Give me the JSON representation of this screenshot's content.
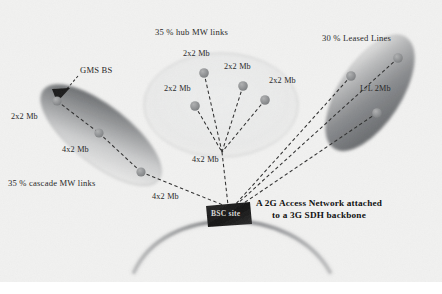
{
  "figure": {
    "background_color": "#f3f3f2",
    "ink_color": "#2a2a2a",
    "node_color": "#8f8f8f",
    "cloud_fill_dark": "#6f7173",
    "cloud_fill_light": "#e9e9e8",
    "bsc_box_color": "#1e1e1e",
    "backbone_arc_color": "#8c8d8e"
  },
  "regions": {
    "cascade": {
      "title": "35 % cascade MW links",
      "bs_label": "GMS BS",
      "link_labels": [
        "2x2 Mb",
        "4x2 Mb"
      ],
      "trunk_label": "4x2 Mb"
    },
    "hub": {
      "title": "35 % hub MW links",
      "node_labels": [
        "2x2 Mb",
        "2x2 Mb",
        "2x2 Mb",
        "2x2 Mb"
      ],
      "trunk_label": "4x2 Mb"
    },
    "leased": {
      "title": "30 % Leased Lines",
      "link_label": "L/L 2Mb"
    }
  },
  "core": {
    "bsc_site_label": "BSC site",
    "caption_line_1": "A 2G Access Network attached",
    "caption_line_2": "to a 3G SDH backbone"
  },
  "nodes": {
    "cascade": [
      {
        "name": "gms-bs-node",
        "x": 57,
        "y": 101
      },
      {
        "name": "cascade-mid-node",
        "x": 99,
        "y": 133
      },
      {
        "name": "cascade-end-node",
        "x": 141,
        "y": 172
      }
    ],
    "hub": [
      {
        "name": "hub-node-1",
        "x": 195,
        "y": 106
      },
      {
        "name": "hub-node-2",
        "x": 204,
        "y": 73
      },
      {
        "name": "hub-node-3",
        "x": 243,
        "y": 86
      },
      {
        "name": "hub-node-4",
        "x": 265,
        "y": 100
      }
    ],
    "leased": [
      {
        "name": "leased-node-1",
        "x": 351,
        "y": 76
      },
      {
        "name": "leased-node-2",
        "x": 398,
        "y": 58
      },
      {
        "name": "leased-node-3",
        "x": 377,
        "y": 113
      }
    ],
    "bsc": {
      "name": "bsc-site-node",
      "x": 228,
      "y": 212
    }
  }
}
